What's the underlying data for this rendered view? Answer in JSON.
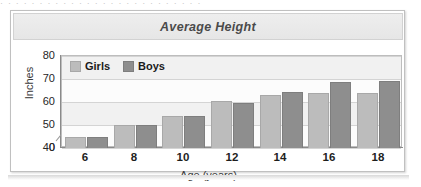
{
  "figure": {
    "title": "Average Height",
    "page_artifact": "· · · · · · · · · · · · · · · · · · · · · · · · · ·"
  },
  "legend": {
    "position": "top-left-inside",
    "entries": [
      {
        "label": "Girls",
        "color": "#bcbcbc"
      },
      {
        "label": "Boys",
        "color": "#8e8e8e"
      }
    ]
  },
  "axes": {
    "y_title": "Inches",
    "x_title": "Age (years)",
    "y_ticks": [
      "80",
      "70",
      "60",
      "50",
      "40",
      "0"
    ],
    "y_break": true,
    "x_ticks": [
      "6",
      "8",
      "10",
      "12",
      "14",
      "16",
      "18"
    ]
  },
  "chart_data": {
    "type": "bar",
    "title": "Average Height",
    "xlabel": "Age (years)",
    "ylabel": "Inches",
    "categories": [
      "6",
      "8",
      "10",
      "12",
      "14",
      "16",
      "18"
    ],
    "series": [
      {
        "name": "Girls",
        "color": "#bcbcbc",
        "values": [
          45,
          50,
          54,
          60.5,
          63,
          64,
          64
        ]
      },
      {
        "name": "Boys",
        "color": "#8e8e8e",
        "values": [
          45,
          50,
          54,
          59.5,
          64.5,
          68.5,
          69
        ]
      }
    ],
    "ylim": [
      40,
      80
    ],
    "y_break_below": 40,
    "y_ticks": [
      40,
      50,
      60,
      70,
      80
    ],
    "grid": true,
    "legend_position": "top-left-inside"
  }
}
